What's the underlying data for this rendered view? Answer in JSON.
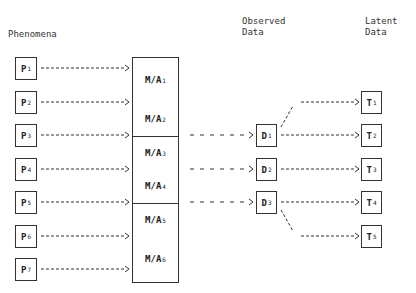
{
  "headers": {
    "phenomena": "Phenomena",
    "observed": "Observed\nData",
    "latent": "Latent\nData"
  },
  "phenomena": [
    {
      "label": "P",
      "sub": "1",
      "y": 57
    },
    {
      "label": "P",
      "sub": "2",
      "y": 91
    },
    {
      "label": "P",
      "sub": "3",
      "y": 124
    },
    {
      "label": "P",
      "sub": "4",
      "y": 158
    },
    {
      "label": "P",
      "sub": "5",
      "y": 191
    },
    {
      "label": "P",
      "sub": "6",
      "y": 225
    },
    {
      "label": "P",
      "sub": "7",
      "y": 258
    }
  ],
  "methods": [
    {
      "label": "M/A",
      "sub": "1",
      "top": 57,
      "bottom": 102
    },
    {
      "label": "M/A",
      "sub": "2",
      "top": 102,
      "bottom": 136
    },
    {
      "label": "M/A",
      "sub": "3",
      "top": 136,
      "bottom": 169
    },
    {
      "label": "M/A",
      "sub": "4",
      "top": 169,
      "bottom": 203
    },
    {
      "label": "M/A",
      "sub": "5",
      "top": 203,
      "bottom": 236
    },
    {
      "label": "M/A",
      "sub": "6",
      "top": 236,
      "bottom": 283
    }
  ],
  "observed": [
    {
      "label": "D",
      "sub": "1",
      "y": 124
    },
    {
      "label": "D",
      "sub": "2",
      "y": 158
    },
    {
      "label": "D",
      "sub": "3",
      "y": 191
    }
  ],
  "latent": [
    {
      "label": "T",
      "sub": "1",
      "y": 91
    },
    {
      "label": "T",
      "sub": "2",
      "y": 124
    },
    {
      "label": "T",
      "sub": "3",
      "y": 158
    },
    {
      "label": "T",
      "sub": "4",
      "y": 191
    },
    {
      "label": "T",
      "sub": "5",
      "y": 225
    }
  ],
  "colors": {
    "line": "#333333",
    "background": "#ffffff"
  }
}
